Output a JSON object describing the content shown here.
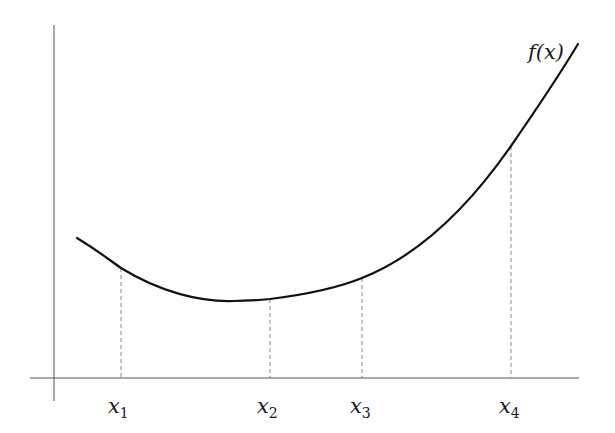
{
  "diagram": {
    "function_label": "f(x)",
    "points": [
      {
        "label": "x",
        "subscript": "1",
        "x": 121,
        "y": 268
      },
      {
        "label": "x",
        "subscript": "2",
        "x": 270,
        "y": 299
      },
      {
        "label": "x",
        "subscript": "3",
        "x": 362,
        "y": 278
      },
      {
        "label": "x",
        "subscript": "4",
        "x": 511,
        "y": 146
      }
    ],
    "colors": {
      "curve": "#111111",
      "axis": "#555555",
      "dashed": "#777777"
    }
  }
}
